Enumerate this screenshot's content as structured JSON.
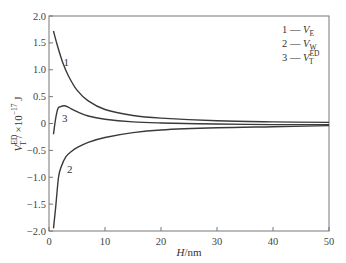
{
  "chart_data": {
    "type": "line",
    "title": "",
    "xlabel": "H/nm",
    "ylabel": "V_T^ED / ×10^-17 J",
    "xlim": [
      0,
      50
    ],
    "ylim": [
      -2.0,
      2.0
    ],
    "xticks": [
      0,
      10,
      20,
      30,
      40,
      50
    ],
    "xtick_labels": [
      "0",
      "10",
      "20",
      "30",
      "40",
      "50"
    ],
    "yticks": [
      2.0,
      1.5,
      1.0,
      0.5,
      0,
      -0.5,
      -1.0,
      -1.5,
      -2.0
    ],
    "ytick_labels": [
      "2.0",
      "1.5",
      "1.0",
      "0.5",
      "0",
      "-0.5",
      "-1.0",
      "-1.5",
      "-2.0"
    ],
    "grid": false,
    "legend_position": "upper right (inside)",
    "legend": [
      {
        "id": "1",
        "dash": "—",
        "name": "V",
        "sub": "E",
        "sup": ""
      },
      {
        "id": "2",
        "dash": "—",
        "name": "V",
        "sub": "W",
        "sup": ""
      },
      {
        "id": "3",
        "dash": "—",
        "name": "V",
        "sub": "T",
        "sup": "ED"
      }
    ],
    "series": [
      {
        "name": "1 — V_E",
        "label": "1",
        "label_at": [
          2.6,
          1.15
        ],
        "x": [
          0.8,
          1.5,
          2.5,
          3.5,
          5,
          7,
          10,
          15,
          20,
          30,
          40,
          50
        ],
        "y": [
          1.72,
          1.45,
          1.12,
          0.88,
          0.62,
          0.42,
          0.26,
          0.15,
          0.1,
          0.05,
          0.03,
          0.02
        ]
      },
      {
        "name": "2 — V_W",
        "label": "2",
        "label_at": [
          3.2,
          -0.85
        ],
        "x": [
          0.8,
          1.2,
          1.7,
          2.2,
          3,
          4,
          5,
          7,
          10,
          15,
          20,
          30,
          40,
          50
        ],
        "y": [
          -1.95,
          -1.55,
          -1.0,
          -0.8,
          -0.62,
          -0.52,
          -0.45,
          -0.35,
          -0.26,
          -0.17,
          -0.12,
          -0.08,
          -0.06,
          -0.04
        ]
      },
      {
        "name": "3 — V_T^ED",
        "label": "3",
        "label_at": [
          2.3,
          0.1
        ],
        "x": [
          0.8,
          1.2,
          1.6,
          2.0,
          2.7,
          3.5,
          5,
          7,
          10,
          15,
          20,
          30,
          40,
          50
        ],
        "y": [
          -0.2,
          0.1,
          0.28,
          0.31,
          0.33,
          0.3,
          0.22,
          0.14,
          0.08,
          0.03,
          0.01,
          -0.01,
          -0.02,
          -0.02
        ]
      }
    ]
  }
}
